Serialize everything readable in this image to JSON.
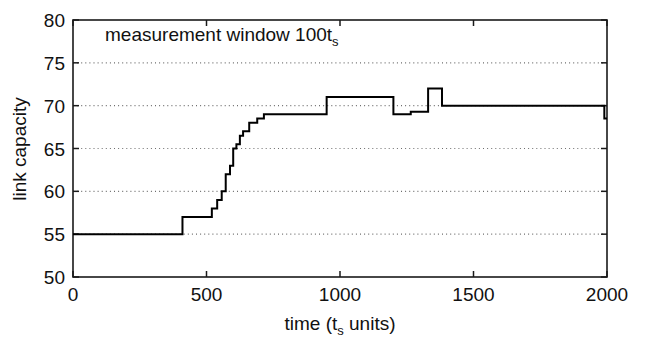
{
  "chart_data": {
    "type": "line",
    "title": "",
    "subtitle": "",
    "xlabel": "time (t_s units)",
    "xlabel_main": "time (t",
    "xlabel_sub": "s",
    "xlabel_tail": " units)",
    "ylabel": "link capacity",
    "xlim": [
      0,
      2000
    ],
    "ylim": [
      50,
      80
    ],
    "xticks": [
      0,
      500,
      1000,
      1500,
      2000
    ],
    "xticklabels": [
      "0",
      "500",
      "1000",
      "1500",
      "2000"
    ],
    "yticks": [
      50,
      55,
      60,
      65,
      70,
      75,
      80
    ],
    "yticklabels": [
      "50",
      "55",
      "60",
      "65",
      "70",
      "75",
      "80"
    ],
    "grid": "horizontal-dotted",
    "gridlines_y": [
      55,
      60,
      65,
      70,
      75
    ],
    "legend": null,
    "legend_position": "none",
    "annotations": [
      {
        "name": "measurement-window-label",
        "text": "measurement window 100t_s",
        "text_main": "measurement window 100t",
        "text_sub": "s",
        "x": 120,
        "y": 77.6
      }
    ],
    "line_color": "#000000",
    "series": [
      {
        "name": "link capacity",
        "drawstyle": "steps-post",
        "x": [
          0,
          390,
          410,
          505,
          520,
          540,
          557,
          572,
          588,
          600,
          612,
          625,
          637,
          660,
          690,
          715,
          950,
          1200,
          1265,
          1330,
          1382,
          1990,
          2000
        ],
        "y": [
          55,
          55,
          57,
          57,
          58,
          59,
          60,
          62,
          63,
          65,
          65.5,
          66.5,
          67,
          68,
          68.5,
          69,
          71,
          69,
          69.3,
          72,
          70,
          68.5,
          68.5
        ]
      }
    ]
  },
  "colors": {
    "axis": "#1a1a1a",
    "grid": "#6e6e6e",
    "data": "#000000",
    "background": "#ffffff",
    "text": "#111111"
  }
}
